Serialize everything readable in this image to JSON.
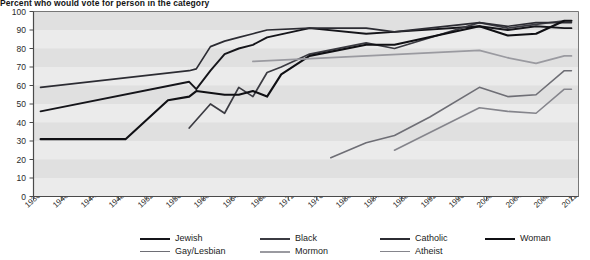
{
  "chart_data": {
    "type": "line",
    "title": "Percent who would vote for person in the category",
    "xlabel": "",
    "ylabel": "",
    "ylim": [
      0,
      100
    ],
    "xlim": [
      1936,
      2013
    ],
    "ytick_step": 10,
    "yticks": [
      0,
      10,
      20,
      30,
      40,
      50,
      60,
      70,
      80,
      90,
      100
    ],
    "xticks": [
      1936,
      1940,
      1944,
      1948,
      1952,
      1956,
      1960,
      1964,
      1968,
      1972,
      1976,
      1980,
      1984,
      1988,
      1992,
      1996,
      2000,
      2004,
      2008,
      2012
    ],
    "grid": "horizontal-bands",
    "legend_position": "bottom",
    "series": [
      {
        "name": "Jewish",
        "color": "#15151a",
        "width": 1.9,
        "points": [
          [
            1937,
            46
          ],
          [
            1958,
            62
          ],
          [
            1959,
            58
          ],
          [
            1961,
            68
          ],
          [
            1963,
            77
          ],
          [
            1965,
            80
          ],
          [
            1967,
            82
          ],
          [
            1969,
            86
          ],
          [
            1975,
            91
          ],
          [
            1983,
            88
          ],
          [
            1987,
            89
          ],
          [
            1999,
            92
          ],
          [
            2003,
            90
          ],
          [
            2007,
            92
          ],
          [
            2011,
            91
          ],
          [
            2012,
            91
          ]
        ]
      },
      {
        "name": "Black",
        "color": "#3b3b42",
        "width": 1.7,
        "points": [
          [
            1958,
            37
          ],
          [
            1961,
            50
          ],
          [
            1963,
            45
          ],
          [
            1965,
            59
          ],
          [
            1967,
            54
          ],
          [
            1969,
            67
          ],
          [
            1971,
            70
          ],
          [
            1975,
            77
          ],
          [
            1983,
            83
          ],
          [
            1987,
            80
          ],
          [
            1999,
            94
          ],
          [
            2003,
            91
          ],
          [
            2007,
            93
          ],
          [
            2011,
            95
          ],
          [
            2012,
            95
          ]
        ]
      },
      {
        "name": "Catholic",
        "color": "#2c2c33",
        "width": 1.7,
        "points": [
          [
            1937,
            59
          ],
          [
            1958,
            68
          ],
          [
            1959,
            69
          ],
          [
            1961,
            81
          ],
          [
            1963,
            84
          ],
          [
            1965,
            86
          ],
          [
            1967,
            88
          ],
          [
            1969,
            90
          ],
          [
            1975,
            91
          ],
          [
            1983,
            91
          ],
          [
            1987,
            89
          ],
          [
            1999,
            94
          ],
          [
            2003,
            92
          ],
          [
            2007,
            94
          ],
          [
            2011,
            94
          ],
          [
            2012,
            94
          ]
        ]
      },
      {
        "name": "Woman",
        "color": "#101014",
        "width": 2.1,
        "points": [
          [
            1937,
            31
          ],
          [
            1949,
            31
          ],
          [
            1955,
            52
          ],
          [
            1958,
            54
          ],
          [
            1959,
            57
          ],
          [
            1963,
            55
          ],
          [
            1965,
            55
          ],
          [
            1967,
            57
          ],
          [
            1969,
            54
          ],
          [
            1971,
            66
          ],
          [
            1975,
            76
          ],
          [
            1983,
            82
          ],
          [
            1987,
            82
          ],
          [
            1999,
            92
          ],
          [
            2003,
            87
          ],
          [
            2007,
            88
          ],
          [
            2011,
            95
          ],
          [
            2012,
            95
          ]
        ]
      },
      {
        "name": "Gay/Lesbian",
        "color": "#6e6e75",
        "width": 1.6,
        "points": [
          [
            1978,
            21
          ],
          [
            1983,
            29
          ],
          [
            1987,
            33
          ],
          [
            1992,
            43
          ],
          [
            1999,
            59
          ],
          [
            2003,
            54
          ],
          [
            2007,
            55
          ],
          [
            2011,
            68
          ],
          [
            2012,
            68
          ]
        ]
      },
      {
        "name": "Mormon",
        "color": "#9a9aa0",
        "width": 1.8,
        "points": [
          [
            1967,
            73
          ],
          [
            1999,
            79
          ],
          [
            2003,
            75
          ],
          [
            2007,
            72
          ],
          [
            2011,
            76
          ],
          [
            2012,
            76
          ]
        ]
      },
      {
        "name": "Atheist",
        "color": "#85858c",
        "width": 1.6,
        "points": [
          [
            1987,
            25
          ],
          [
            1999,
            48
          ],
          [
            2003,
            46
          ],
          [
            2007,
            45
          ],
          [
            2011,
            58
          ],
          [
            2012,
            58
          ]
        ]
      }
    ]
  },
  "legend": {
    "rows": [
      [
        {
          "label": "Jewish",
          "color": "#15151a",
          "width": 2.2
        },
        {
          "label": "Black",
          "color": "#3b3b42",
          "width": 2.0
        },
        {
          "label": "Catholic",
          "color": "#2c2c33",
          "width": 2.0
        },
        {
          "label": "Woman",
          "color": "#101014",
          "width": 2.4
        }
      ],
      [
        {
          "label": "Gay/Lesbian",
          "color": "#6e6e75",
          "width": 1.8
        },
        {
          "label": "Mormon",
          "color": "#9a9aa0",
          "width": 2.0
        },
        {
          "label": "Atheist",
          "color": "#85858c",
          "width": 1.8
        }
      ]
    ]
  },
  "colors": {
    "plot_background": "#ebebeb",
    "band": "#e0e0e0",
    "axis": "#4a4a4a",
    "text": "#1b1b1b"
  }
}
